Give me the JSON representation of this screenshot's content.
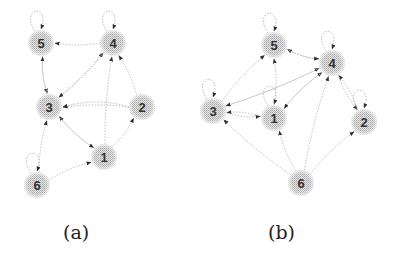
{
  "figure": {
    "panels": [
      {
        "id": "a",
        "caption": "(a)",
        "caption_pos": [
          77,
          235
        ],
        "nodes": [
          {
            "label": "5",
            "x": 41,
            "y": 43
          },
          {
            "label": "4",
            "x": 113,
            "y": 43
          },
          {
            "label": "3",
            "x": 49,
            "y": 107
          },
          {
            "label": "2",
            "x": 142,
            "y": 107
          },
          {
            "label": "1",
            "x": 104,
            "y": 157
          },
          {
            "label": "6",
            "x": 37,
            "y": 185
          }
        ],
        "edges": [
          {
            "from": "4",
            "to": "5"
          },
          {
            "from": "2",
            "to": "3"
          },
          {
            "from": "1",
            "to": "3"
          },
          {
            "from": "5",
            "to": "3"
          },
          {
            "from": "6",
            "to": "3"
          },
          {
            "from": "3",
            "to": "4"
          },
          {
            "from": "1",
            "to": "4"
          },
          {
            "from": "2",
            "to": "4"
          },
          {
            "from": "3",
            "to": "5"
          },
          {
            "from": "1",
            "to": "2"
          },
          {
            "from": "6",
            "to": "1"
          },
          {
            "from": "3",
            "to": "1"
          },
          {
            "from": "4",
            "to": "3"
          },
          {
            "from": "2",
            "to": "3",
            "curve": 1
          }
        ],
        "self_loops": [
          "5",
          "4",
          "6"
        ]
      },
      {
        "id": "b",
        "caption": "(b)",
        "caption_pos": [
          282,
          235
        ],
        "nodes": [
          {
            "label": "5",
            "x": 274,
            "y": 45
          },
          {
            "label": "4",
            "x": 332,
            "y": 63
          },
          {
            "label": "3",
            "x": 213,
            "y": 111
          },
          {
            "label": "1",
            "x": 274,
            "y": 118
          },
          {
            "label": "2",
            "x": 364,
            "y": 122
          },
          {
            "label": "6",
            "x": 301,
            "y": 183
          }
        ],
        "edges": [
          {
            "from": "4",
            "to": "5"
          },
          {
            "from": "1",
            "to": "5"
          },
          {
            "from": "3",
            "to": "5"
          },
          {
            "from": "3",
            "to": "4"
          },
          {
            "from": "1",
            "to": "4"
          },
          {
            "from": "2",
            "to": "4"
          },
          {
            "from": "6",
            "to": "4"
          },
          {
            "from": "5",
            "to": "4"
          },
          {
            "from": "4",
            "to": "3"
          },
          {
            "from": "1",
            "to": "3"
          },
          {
            "from": "6",
            "to": "3"
          },
          {
            "from": "3",
            "to": "1"
          },
          {
            "from": "6",
            "to": "1"
          },
          {
            "from": "4",
            "to": "2"
          },
          {
            "from": "6",
            "to": "2"
          },
          {
            "from": "4",
            "to": "1"
          }
        ],
        "self_loops": [
          "5",
          "4",
          "3",
          "1",
          "2"
        ]
      }
    ],
    "colors": {
      "node_fill": "#d4d4d4",
      "node_stipple": "#b0b0b0",
      "edge": "#bdbdbd",
      "arrow": "#333333",
      "label": "#333333"
    }
  }
}
